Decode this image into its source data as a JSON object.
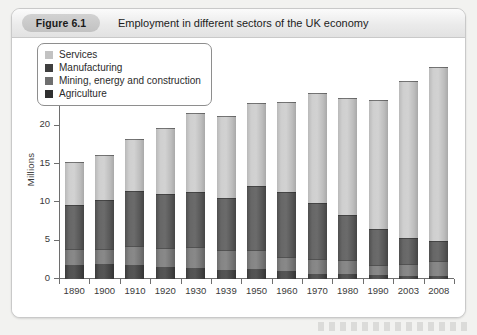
{
  "figure": {
    "badge": "Figure 6.1",
    "caption": "Employment in different sectors of the UK economy"
  },
  "legend": {
    "position": "top-left",
    "items": [
      {
        "label": "Services",
        "key": "services",
        "color": "#c2c2c2"
      },
      {
        "label": "Manufacturing",
        "key": "manufacturing",
        "color": "#3f3f3f"
      },
      {
        "label": "Mining, energy and construction",
        "key": "mining",
        "color": "#6f6f6f"
      },
      {
        "label": "Agriculture",
        "key": "agriculture",
        "color": "#2f2f2f"
      }
    ]
  },
  "axis": {
    "y_label": "Millions",
    "y_ticks": [
      0,
      5,
      10,
      15,
      20,
      25,
      30
    ],
    "y_min": 0,
    "y_max": 30
  },
  "chart_data": {
    "type": "bar",
    "stacked": true,
    "title": "Employment in different sectors of the UK economy",
    "xlabel": "",
    "ylabel": "Millions",
    "ylim": [
      0,
      30
    ],
    "yticks": [
      0,
      5,
      10,
      15,
      20,
      25,
      30
    ],
    "grid": false,
    "legend_position": "top-left",
    "categories": [
      "1890",
      "1900",
      "1910",
      "1920",
      "1930",
      "1939",
      "1950",
      "1960",
      "1970",
      "1980",
      "1990",
      "2003",
      "2008"
    ],
    "series": [
      {
        "name": "Agriculture",
        "color": "#2f2f2f",
        "values": [
          1.8,
          1.9,
          1.8,
          1.6,
          1.4,
          1.2,
          1.3,
          1.0,
          0.7,
          0.6,
          0.5,
          0.4,
          0.4
        ]
      },
      {
        "name": "Mining, energy and construction",
        "color": "#6f6f6f",
        "values": [
          2.1,
          2.0,
          2.5,
          2.4,
          2.8,
          2.6,
          2.5,
          1.9,
          1.9,
          1.9,
          1.3,
          1.6,
          1.9
        ]
      },
      {
        "name": "Manufacturing",
        "color": "#3f3f3f",
        "values": [
          5.7,
          6.4,
          7.2,
          7.1,
          7.2,
          6.8,
          8.3,
          8.4,
          7.3,
          5.9,
          4.7,
          3.3,
          2.7
        ]
      },
      {
        "name": "Services",
        "color": "#c2c2c2",
        "values": [
          5.7,
          5.9,
          6.7,
          8.6,
          10.2,
          10.6,
          10.8,
          11.8,
          14.4,
          15.2,
          16.8,
          20.5,
          22.6
        ]
      }
    ],
    "cumulative_tops": {
      "agriculture": [
        1.8,
        1.9,
        1.8,
        1.6,
        1.4,
        1.2,
        1.3,
        1.0,
        0.7,
        0.6,
        0.5,
        0.4,
        0.4
      ],
      "mining": [
        3.9,
        3.9,
        4.3,
        4.0,
        4.2,
        3.8,
        3.8,
        2.9,
        2.6,
        2.5,
        1.8,
        2.0,
        2.3
      ],
      "manufacturing": [
        9.6,
        10.3,
        11.5,
        11.1,
        11.4,
        10.6,
        12.1,
        11.3,
        9.9,
        8.4,
        6.5,
        5.3,
        5.0
      ],
      "services": [
        15.3,
        16.2,
        18.2,
        19.7,
        21.6,
        21.2,
        22.9,
        23.1,
        24.3,
        23.6,
        23.3,
        25.8,
        27.6
      ]
    },
    "totals": [
      15.3,
      16.2,
      18.2,
      19.7,
      21.6,
      21.2,
      22.9,
      23.1,
      24.3,
      23.6,
      23.3,
      25.8,
      27.6
    ]
  }
}
